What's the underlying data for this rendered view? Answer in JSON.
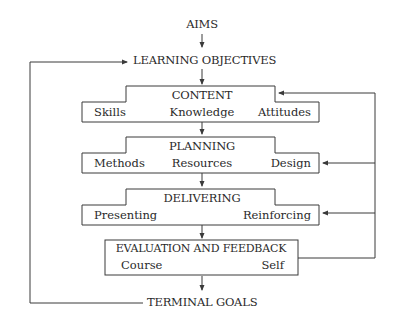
{
  "diagram": {
    "top": {
      "aims": "AIMS",
      "objectives": "LEARNING OBJECTIVES"
    },
    "content": {
      "title": "CONTENT",
      "items": [
        "Skills",
        "Knowledge",
        "Attitudes"
      ]
    },
    "planning": {
      "title": "PLANNING",
      "items": [
        "Methods",
        "Resources",
        "Design"
      ]
    },
    "delivering": {
      "title": "DELIVERING",
      "items": [
        "Presenting",
        "Reinforcing"
      ]
    },
    "evaluation": {
      "title": "EVALUATION AND FEEDBACK",
      "items": [
        "Course",
        "Self"
      ]
    },
    "bottom": {
      "goals": "TERMINAL GOALS"
    },
    "colors": {
      "line": "#3a3a3a",
      "text": "#2a2a2a",
      "background": "#ffffff"
    }
  }
}
